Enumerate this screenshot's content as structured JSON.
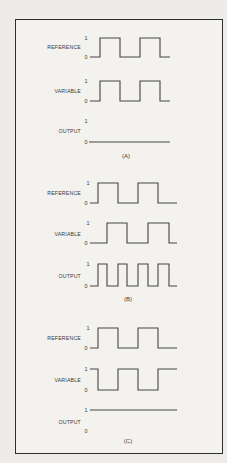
{
  "figure": {
    "panels": [
      {
        "caption": "(A)",
        "signals": [
          {
            "name": "REFERENCE",
            "high_label": "1",
            "low_label": "0",
            "pattern": "square",
            "description": "square wave, two high pulses"
          },
          {
            "name": "VARIABLE",
            "high_label": "1",
            "low_label": "0",
            "pattern": "square",
            "description": "in phase with reference"
          },
          {
            "name": "OUTPUT",
            "high_label": "1",
            "low_label": "0",
            "pattern": "constant-0",
            "description": "flat at 0"
          }
        ]
      },
      {
        "caption": "(B)",
        "signals": [
          {
            "name": "REFERENCE",
            "high_label": "1",
            "low_label": "0",
            "pattern": "square",
            "description": "square wave, two high pulses"
          },
          {
            "name": "VARIABLE",
            "high_label": "1",
            "low_label": "0",
            "pattern": "square-shifted",
            "description": "shifted 90 degrees from reference"
          },
          {
            "name": "OUTPUT",
            "high_label": "1",
            "low_label": "0",
            "pattern": "double-frequency",
            "description": "four pulses, double frequency"
          }
        ]
      },
      {
        "caption": "(C)",
        "signals": [
          {
            "name": "REFERENCE",
            "high_label": "1",
            "low_label": "0",
            "pattern": "square",
            "description": "square wave, two high pulses"
          },
          {
            "name": "VARIABLE",
            "high_label": "1",
            "low_label": "0",
            "pattern": "square-inverted",
            "description": "180 degrees out of phase with reference"
          },
          {
            "name": "OUTPUT",
            "high_label": "1",
            "low_label": "0",
            "pattern": "constant-1",
            "description": "flat at 1"
          }
        ]
      }
    ]
  }
}
